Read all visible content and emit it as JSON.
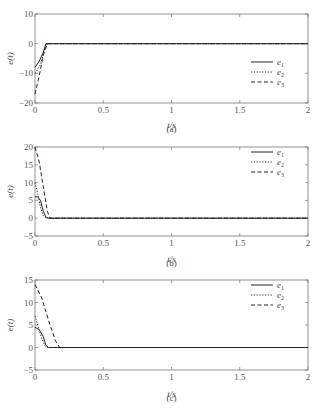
{
  "chart_data": [
    {
      "type": "line",
      "panel": "(a)",
      "xlabel": "t/s",
      "ylabel": "e(t)",
      "xlim": [
        0,
        2
      ],
      "ylim": [
        -20,
        10
      ],
      "xticks": [
        "0",
        "0.5",
        "1",
        "1.5",
        "2"
      ],
      "yticks": [
        "10",
        "0",
        "-10",
        "-20"
      ],
      "legend": [
        "e1",
        "e2",
        "e3"
      ],
      "legend_position": "right-lower",
      "series": [
        {
          "name": "e1",
          "style": "solid",
          "x": [
            0,
            0.03,
            0.06,
            0.08,
            2
          ],
          "y": [
            -8,
            -6,
            -3,
            0,
            0
          ]
        },
        {
          "name": "e2",
          "style": "dotted",
          "x": [
            0,
            0.04,
            0.07,
            0.09,
            2
          ],
          "y": [
            -10,
            -7,
            -2,
            0,
            0
          ]
        },
        {
          "name": "e3",
          "style": "dashed",
          "x": [
            0,
            0.03,
            0.06,
            0.09,
            2
          ],
          "y": [
            -17,
            -11,
            -4,
            0,
            0
          ]
        }
      ]
    },
    {
      "type": "line",
      "panel": "(b)",
      "xlabel": "t/s",
      "ylabel": "e(t)",
      "xlim": [
        0,
        2
      ],
      "ylim": [
        -5,
        20
      ],
      "xticks": [
        "0",
        "0.5",
        "1",
        "1.5",
        "2"
      ],
      "yticks": [
        "20",
        "15",
        "10",
        "5",
        "0",
        "-5"
      ],
      "legend": [
        "e1",
        "e2",
        "e3"
      ],
      "legend_position": "right-upper",
      "series": [
        {
          "name": "e1",
          "style": "solid",
          "x": [
            0,
            0.02,
            0.04,
            0.06,
            0.08,
            0.1,
            2
          ],
          "y": [
            6,
            6,
            5,
            2,
            0.3,
            0,
            0
          ]
        },
        {
          "name": "e2",
          "style": "dotted",
          "x": [
            0,
            0.02,
            0.04,
            0.06,
            0.08,
            2
          ],
          "y": [
            10,
            7,
            3,
            0.8,
            0,
            0
          ]
        },
        {
          "name": "e3",
          "style": "dashed",
          "x": [
            0,
            0.03,
            0.06,
            0.09,
            0.11,
            2
          ],
          "y": [
            20,
            16,
            9,
            2,
            0,
            0
          ]
        }
      ]
    },
    {
      "type": "line",
      "panel": "(c)",
      "xlabel": "t/s",
      "ylabel": "e(t)",
      "xlim": [
        0,
        2
      ],
      "ylim": [
        -5,
        15
      ],
      "xticks": [
        "0",
        "0.5",
        "1",
        "1.5",
        "2"
      ],
      "yticks": [
        "15",
        "10",
        "5",
        "0",
        "-5"
      ],
      "legend": [
        "e1",
        "e2",
        "e3"
      ],
      "legend_position": "right-upper",
      "series": [
        {
          "name": "e1",
          "style": "solid",
          "x": [
            0,
            0.03,
            0.06,
            0.08,
            0.1,
            2
          ],
          "y": [
            4.5,
            4,
            2.5,
            0.5,
            0,
            0
          ]
        },
        {
          "name": "e2",
          "style": "dotted",
          "x": [
            0,
            0.02,
            0.05,
            0.07,
            0.09,
            2
          ],
          "y": [
            7,
            5,
            2,
            0.5,
            0,
            0
          ]
        },
        {
          "name": "e3",
          "style": "dashed",
          "x": [
            0,
            0.05,
            0.1,
            0.15,
            0.18,
            2
          ],
          "y": [
            14,
            11,
            6,
            1.5,
            0,
            0
          ]
        }
      ]
    }
  ]
}
